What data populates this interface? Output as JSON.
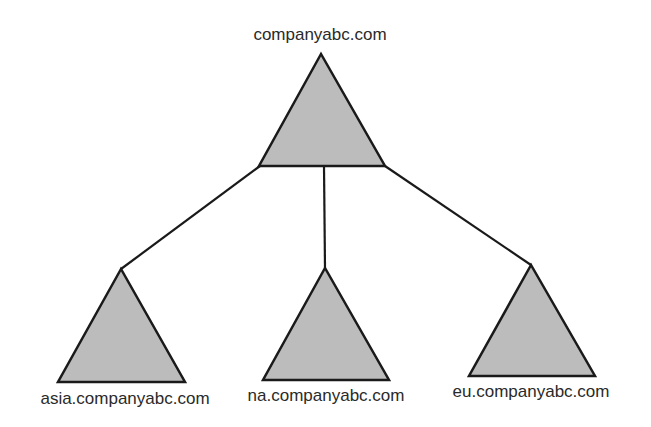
{
  "diagram": {
    "type": "domain-tree",
    "colors": {
      "triangle_fill": "#bcbcbc",
      "stroke": "#1a1a1a",
      "text": "#2a2a2a",
      "background": "#ffffff"
    },
    "root": {
      "label": "companyabc.com"
    },
    "children": [
      {
        "label": "asia.companyabc.com"
      },
      {
        "label": "na.companyabc.com"
      },
      {
        "label": "eu.companyabc.com"
      }
    ]
  }
}
